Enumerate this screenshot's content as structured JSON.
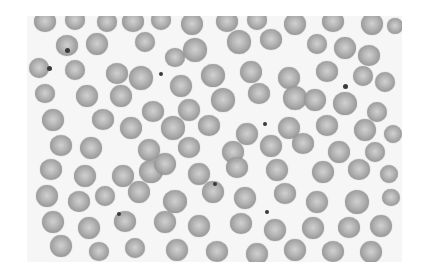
{
  "image": {
    "subject": "Peripheral blood smear micrograph showing red blood cells (erythrocytes)",
    "color_mode": "grayscale",
    "background_color": "#f6f6f6",
    "cell_color": "#9a9a9a",
    "platelet_color": "#3a3a3a"
  },
  "caption": "Blood smear micrograph"
}
